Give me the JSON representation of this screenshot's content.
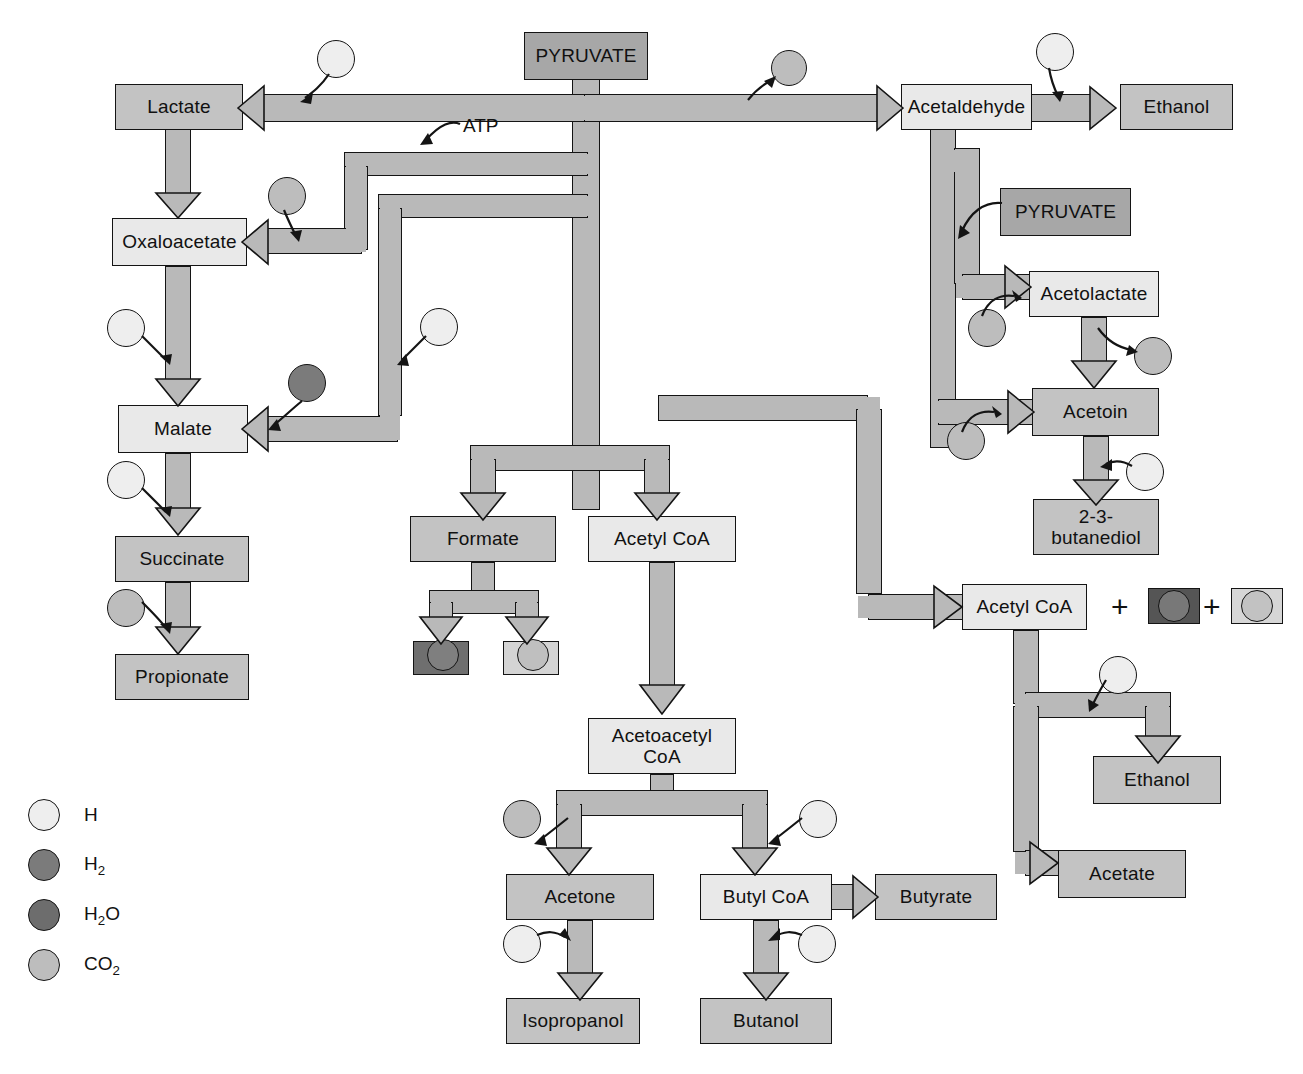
{
  "diagram": {
    "type": "metabolic-pathway-flowchart"
  },
  "nodes": [
    {
      "id": "pyruvate_top",
      "label": "PYRUVATE",
      "x": 524,
      "y": 32,
      "w": 124,
      "h": 48,
      "fill": "dark"
    },
    {
      "id": "lactate",
      "label": "Lactate",
      "x": 115,
      "y": 84,
      "w": 128,
      "h": 46,
      "fill": "mid"
    },
    {
      "id": "acetaldehyde",
      "label": "Acetaldehyde",
      "x": 901,
      "y": 84,
      "w": 131,
      "h": 46,
      "fill": "light"
    },
    {
      "id": "ethanol_top",
      "label": "Ethanol",
      "x": 1120,
      "y": 84,
      "w": 113,
      "h": 46,
      "fill": "mid"
    },
    {
      "id": "oxaloacetate",
      "label": "Oxaloacetate",
      "x": 112,
      "y": 218,
      "w": 135,
      "h": 48,
      "fill": "light"
    },
    {
      "id": "pyruvate_right",
      "label": "PYRUVATE",
      "x": 1000,
      "y": 188,
      "w": 131,
      "h": 48,
      "fill": "dark"
    },
    {
      "id": "acetolactate",
      "label": "Acetolactate",
      "x": 1029,
      "y": 271,
      "w": 130,
      "h": 46,
      "fill": "light"
    },
    {
      "id": "malate",
      "label": "Malate",
      "x": 118,
      "y": 405,
      "w": 130,
      "h": 48,
      "fill": "light"
    },
    {
      "id": "acetoin",
      "label": "Acetoin",
      "x": 1032,
      "y": 388,
      "w": 127,
      "h": 48,
      "fill": "mid"
    },
    {
      "id": "formate",
      "label": "Formate",
      "x": 410,
      "y": 516,
      "w": 146,
      "h": 46,
      "fill": "mid"
    },
    {
      "id": "acetylcoa_mid",
      "label": "Acetyl CoA",
      "x": 588,
      "y": 516,
      "w": 148,
      "h": 46,
      "fill": "light"
    },
    {
      "id": "butanediol",
      "label": "2-3-\nbutanediol",
      "x": 1033,
      "y": 499,
      "w": 126,
      "h": 56,
      "fill": "mid"
    },
    {
      "id": "succinate",
      "label": "Succinate",
      "x": 115,
      "y": 536,
      "w": 134,
      "h": 46,
      "fill": "mid"
    },
    {
      "id": "acetylcoa_right",
      "label": "Acetyl CoA",
      "x": 962,
      "y": 584,
      "w": 125,
      "h": 46,
      "fill": "light"
    },
    {
      "id": "propionate",
      "label": "Propionate",
      "x": 115,
      "y": 654,
      "w": 134,
      "h": 46,
      "fill": "mid"
    },
    {
      "id": "acetoacetylcoa",
      "label": "Acetoacetyl\nCoA",
      "x": 588,
      "y": 718,
      "w": 148,
      "h": 56,
      "fill": "light"
    },
    {
      "id": "ethanol_right",
      "label": "Ethanol",
      "x": 1093,
      "y": 756,
      "w": 128,
      "h": 48,
      "fill": "mid"
    },
    {
      "id": "acetate",
      "label": "Acetate",
      "x": 1058,
      "y": 850,
      "w": 128,
      "h": 48,
      "fill": "mid"
    },
    {
      "id": "acetone",
      "label": "Acetone",
      "x": 506,
      "y": 874,
      "w": 148,
      "h": 46,
      "fill": "mid"
    },
    {
      "id": "butylcoa",
      "label": "Butyl CoA",
      "x": 700,
      "y": 874,
      "w": 132,
      "h": 46,
      "fill": "light"
    },
    {
      "id": "butyrate",
      "label": "Butyrate",
      "x": 875,
      "y": 874,
      "w": 122,
      "h": 46,
      "fill": "mid"
    },
    {
      "id": "isopropanol",
      "label": "Isopropanol",
      "x": 506,
      "y": 998,
      "w": 134,
      "h": 46,
      "fill": "mid"
    },
    {
      "id": "butanol",
      "label": "Butanol",
      "x": 700,
      "y": 998,
      "w": 132,
      "h": 46,
      "fill": "mid"
    }
  ],
  "product_boxes": [
    {
      "id": "formate_h2",
      "species": "H2",
      "x": 413,
      "y": 641,
      "w": 56,
      "h": 34,
      "box_fill": "#6f6f6f",
      "circle_fill": "#7f7f7f"
    },
    {
      "id": "formate_co2",
      "species": "CO2",
      "x": 503,
      "y": 641,
      "w": 56,
      "h": 34,
      "box_fill": "#d4d4d4",
      "circle_fill": "#bfbfbf"
    },
    {
      "id": "acoa_h2o",
      "species": "H2O",
      "x": 1148,
      "y": 588,
      "w": 52,
      "h": 36,
      "box_fill": "#555555",
      "circle_fill": "#787878"
    },
    {
      "id": "acoa_co2",
      "species": "CO2",
      "x": 1231,
      "y": 588,
      "w": 52,
      "h": 36,
      "box_fill": "#d6d6d6",
      "circle_fill": "#c2c2c2"
    }
  ],
  "cofactors": [
    {
      "id": "cof_lactate_h",
      "species": "H",
      "x": 317,
      "y": 40,
      "d": 38
    },
    {
      "id": "cof_acetald_co2",
      "species": "CO2",
      "x": 771,
      "y": 50,
      "d": 36
    },
    {
      "id": "cof_ethanol_h",
      "species": "H",
      "x": 1036,
      "y": 33,
      "d": 38
    },
    {
      "id": "cof_oxalo_co2",
      "species": "CO2",
      "x": 268,
      "y": 177,
      "d": 38
    },
    {
      "id": "cof_malate_h_left",
      "species": "H",
      "x": 107,
      "y": 309,
      "d": 38
    },
    {
      "id": "cof_malate_h_right",
      "species": "H",
      "x": 420,
      "y": 308,
      "d": 38
    },
    {
      "id": "cof_malate_h2",
      "species": "H2",
      "x": 288,
      "y": 364,
      "d": 38
    },
    {
      "id": "cof_acetolac_co2",
      "species": "CO2",
      "x": 968,
      "y": 309,
      "d": 38
    },
    {
      "id": "cof_acetolac_out",
      "species": "CO2",
      "x": 1134,
      "y": 337,
      "d": 38
    },
    {
      "id": "cof_succinate_h",
      "species": "H",
      "x": 107,
      "y": 461,
      "d": 38
    },
    {
      "id": "cof_acetoin_co2",
      "species": "CO2",
      "x": 947,
      "y": 422,
      "d": 38
    },
    {
      "id": "cof_butanediol_h",
      "species": "H",
      "x": 1126,
      "y": 453,
      "d": 38
    },
    {
      "id": "cof_propionate_co2",
      "species": "CO2",
      "x": 107,
      "y": 589,
      "d": 38
    },
    {
      "id": "cof_ethanolR_h",
      "species": "H",
      "x": 1099,
      "y": 656,
      "d": 38
    },
    {
      "id": "cof_acetone_co2",
      "species": "CO2",
      "x": 503,
      "y": 800,
      "d": 38
    },
    {
      "id": "cof_butylcoa_h",
      "species": "H",
      "x": 799,
      "y": 800,
      "d": 38
    },
    {
      "id": "cof_isoprop_h",
      "species": "H",
      "x": 503,
      "y": 925,
      "d": 38
    },
    {
      "id": "cof_butanol_h",
      "species": "H",
      "x": 798,
      "y": 925,
      "d": 38
    }
  ],
  "labels": {
    "atp": "ATP"
  },
  "plus_signs": [
    "+",
    "+"
  ],
  "legend": {
    "items": [
      {
        "species": "H",
        "label": "H",
        "color": "#eeeeee"
      },
      {
        "species": "H2",
        "label": "H₂",
        "color": "#7b7b7b"
      },
      {
        "species": "H2O",
        "label": "H₂O",
        "color": "#6d6d6d"
      },
      {
        "species": "CO2",
        "label": "CO₂",
        "color": "#bdbdbd"
      }
    ]
  },
  "colors": {
    "pipe_fill": "#b9b9b9",
    "outline": "#141414",
    "box_dark": "#a7a7a7",
    "box_mid": "#c3c3c3",
    "box_light": "#e9e9e9",
    "background": "#ffffff"
  }
}
